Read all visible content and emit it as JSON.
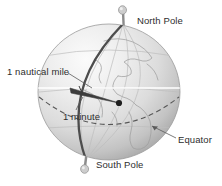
{
  "figure": {
    "title": "",
    "background_color": "#ffffff",
    "labels": {
      "north_pole": "North Pole",
      "south_pole": "South Pole",
      "equator": "Equator",
      "nautical_mile": "1 nautical mile",
      "minute": "1 minute"
    },
    "colors": {
      "text": "#2e2e2e",
      "globe_light": "#f2f2f2",
      "globe_mid": "#cfcfcf",
      "globe_dark": "#9a9a9a",
      "globe_edge": "#8e8e8e",
      "meridian": "#4a4a4a",
      "equator_dash": "#5a5a5a",
      "graticule": "#b4b4b4",
      "coastline": "#a8a8a8",
      "white_line": "#ffffff",
      "wedge": "#3c3c3c",
      "pin": "#b0b0b0",
      "leader": "#555555"
    },
    "geometry": {
      "globe_center_x": 109,
      "globe_center_y": 92,
      "globe_radius_x": 71,
      "globe_radius_y": 68,
      "north_pin_x": 123,
      "north_pin_y": 24,
      "south_pin_x": 86,
      "south_pin_y": 160,
      "center_dot_x": 119,
      "center_dot_y": 103
    }
  }
}
